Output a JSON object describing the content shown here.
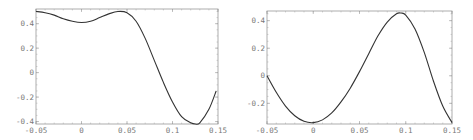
{
  "chart_data": [
    {
      "type": "line",
      "title": "",
      "xlabel": "",
      "ylabel": "",
      "xlim": [
        -0.05,
        0.15
      ],
      "ylim": [
        -0.42,
        0.52
      ],
      "grid": false,
      "legend": null,
      "x_ticks": [
        "-0.05",
        "0",
        "0.05",
        "0.1",
        "0.15"
      ],
      "y_ticks": [
        "0.4",
        "0.2",
        "0",
        "-0.2",
        "-0.4"
      ],
      "series": [
        {
          "name": "curve",
          "x": [
            -0.05,
            -0.04,
            -0.03,
            -0.02,
            -0.01,
            0.0,
            0.01,
            0.02,
            0.03,
            0.04,
            0.05,
            0.06,
            0.07,
            0.08,
            0.09,
            0.1,
            0.11,
            0.12,
            0.125,
            0.13,
            0.14,
            0.148
          ],
          "y": [
            0.5,
            0.49,
            0.47,
            0.44,
            0.42,
            0.41,
            0.42,
            0.45,
            0.48,
            0.5,
            0.49,
            0.42,
            0.28,
            0.1,
            -0.08,
            -0.24,
            -0.36,
            -0.41,
            -0.42,
            -0.41,
            -0.3,
            -0.15
          ]
        }
      ],
      "frame": {
        "x0": 36,
        "x1": 218,
        "y0": 9,
        "y1": 124
      }
    },
    {
      "type": "line",
      "title": "",
      "xlabel": "",
      "ylabel": "",
      "xlim": [
        -0.05,
        0.15
      ],
      "ylim": [
        -0.35,
        0.47
      ],
      "grid": false,
      "legend": null,
      "x_ticks": [
        "-0.05",
        "0",
        "0.05",
        "0.1",
        "0.15"
      ],
      "y_ticks": [
        "0.4",
        "0.2",
        "0",
        "-0.2"
      ],
      "series": [
        {
          "name": "curve",
          "x": [
            -0.05,
            -0.04,
            -0.03,
            -0.02,
            -0.01,
            0.0,
            0.01,
            0.02,
            0.03,
            0.04,
            0.05,
            0.06,
            0.07,
            0.08,
            0.09,
            0.095,
            0.1,
            0.11,
            0.12,
            0.13,
            0.14,
            0.15
          ],
          "y": [
            0.0,
            -0.12,
            -0.22,
            -0.29,
            -0.33,
            -0.34,
            -0.32,
            -0.27,
            -0.19,
            -0.09,
            0.03,
            0.16,
            0.29,
            0.39,
            0.45,
            0.455,
            0.44,
            0.34,
            0.17,
            -0.04,
            -0.22,
            -0.34
          ]
        }
      ],
      "frame": {
        "x0": 31,
        "x1": 216,
        "y0": 11,
        "y1": 124
      }
    }
  ],
  "colors": {
    "line": "#333333",
    "frame": "#999999",
    "tick_label": "#777777"
  }
}
